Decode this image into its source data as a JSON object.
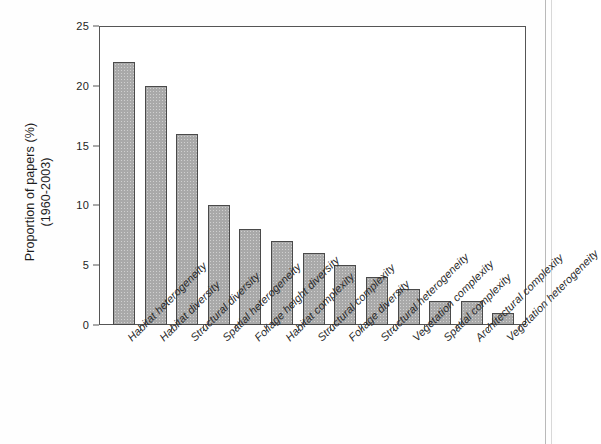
{
  "figure": {
    "background_color": "#fefefe",
    "bar_fill_color": "#a9a9a9",
    "bar_edge_color": "#4a4a4a",
    "axis_color": "#555555"
  },
  "chart_data": {
    "type": "bar",
    "title": "",
    "subtitle": "",
    "xlabel": "",
    "ylabel": "Proportion of papers (%) (1960-2003)",
    "ylabel_lines": [
      "Proportion of papers (%)",
      "(1960-2003)"
    ],
    "ylim": [
      0,
      25
    ],
    "ytick_values": [
      0,
      5,
      10,
      15,
      20,
      25
    ],
    "ytick_labels": [
      "0",
      "5",
      "10",
      "15",
      "20",
      "25"
    ],
    "grid": false,
    "legend": false,
    "legend_position": "none",
    "categories": [
      "Habitat heterogeneity",
      "Habitat diversity",
      "Structural diversity",
      "Spatial heterogeneity",
      "Foliage height diversity",
      "Habitat complexity",
      "Structural complexity",
      "Foliage diversity",
      "Structural heterogeneity",
      "Vegetation complexity",
      "Spatial complexity",
      "Architectural complexity",
      "Vegetation heterogeneity"
    ],
    "values": [
      22,
      20,
      16,
      10,
      8,
      7,
      6,
      5,
      4,
      3,
      2,
      2,
      1
    ],
    "units": "%"
  }
}
